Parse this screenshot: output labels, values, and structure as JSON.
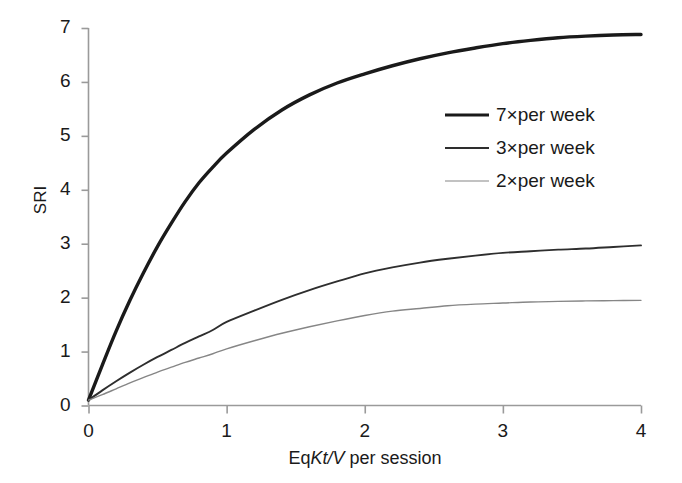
{
  "chart_data": {
    "type": "line",
    "title": "",
    "xlabel": "EqKt/V per session",
    "xlabel_parts": {
      "prefix": "Eq",
      "italic": "Kt/V",
      "suffix": " per session"
    },
    "ylabel": "SRI",
    "xlim": [
      0,
      4
    ],
    "ylim": [
      0,
      7
    ],
    "xticks": [
      "0",
      "1",
      "2",
      "3",
      "4"
    ],
    "yticks": [
      "0",
      "1",
      "2",
      "3",
      "4",
      "5",
      "6",
      "7"
    ],
    "grid": false,
    "legend_position": "upper right",
    "x": [
      0,
      0.1,
      0.2,
      0.3,
      0.4,
      0.5,
      0.6,
      0.7,
      0.8,
      0.9,
      1.0,
      1.2,
      1.4,
      1.6,
      1.8,
      2.0,
      2.2,
      2.4,
      2.6,
      2.8,
      3.0,
      3.2,
      3.4,
      3.6,
      3.8,
      4.0
    ],
    "series": [
      {
        "name": "7×per week",
        "color": "#1a1a1a",
        "width": 3.4,
        "values": [
          0.1,
          0.75,
          1.38,
          1.95,
          2.47,
          2.95,
          3.38,
          3.78,
          4.13,
          4.42,
          4.68,
          5.12,
          5.48,
          5.76,
          5.98,
          6.15,
          6.3,
          6.43,
          6.54,
          6.63,
          6.71,
          6.77,
          6.82,
          6.85,
          6.87,
          6.88
        ]
      },
      {
        "name": "3×per week",
        "color": "#2e2e2e",
        "width": 1.9,
        "values": [
          0.1,
          0.28,
          0.45,
          0.61,
          0.76,
          0.9,
          1.03,
          1.16,
          1.28,
          1.4,
          1.55,
          1.76,
          1.96,
          2.14,
          2.3,
          2.45,
          2.56,
          2.65,
          2.72,
          2.78,
          2.83,
          2.86,
          2.89,
          2.91,
          2.94,
          2.97
        ]
      },
      {
        "name": "2×per week",
        "color": "#868686",
        "width": 1.4,
        "values": [
          0.1,
          0.2,
          0.31,
          0.42,
          0.52,
          0.62,
          0.71,
          0.8,
          0.88,
          0.96,
          1.05,
          1.2,
          1.34,
          1.46,
          1.57,
          1.67,
          1.75,
          1.8,
          1.85,
          1.88,
          1.9,
          1.92,
          1.93,
          1.94,
          1.945,
          1.95
        ]
      }
    ]
  },
  "legend": {
    "entries": [
      {
        "label": "7×per week"
      },
      {
        "label": "3×per week"
      },
      {
        "label": "2×per week"
      }
    ]
  },
  "axes": {
    "y_tick_labels": [
      "7",
      "6",
      "5",
      "4",
      "3",
      "2",
      "1",
      "0"
    ],
    "x_tick_labels": [
      "0",
      "1",
      "2",
      "3",
      "4"
    ],
    "axis_color": "#9a9a9a"
  }
}
